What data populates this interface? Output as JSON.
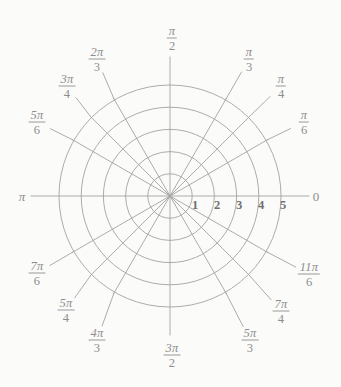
{
  "figure": {
    "type": "polar-grid",
    "title": "",
    "background_color": "#fbfbfa",
    "grid_color": "#a3a3a3",
    "label_color": "#8d8d8d",
    "tick_label_color": "#6f6f6f"
  },
  "chart_data": {
    "type": "polar-grid",
    "title": "",
    "xlabel": "",
    "ylabel": "",
    "grid": true,
    "legend": "none",
    "center_px": [
      170,
      196
    ],
    "outer_radius_px": 111,
    "radial_ticks": [
      1,
      2,
      3,
      4,
      5
    ],
    "radial_range": [
      0,
      5
    ],
    "radial_tick_labels": [
      "1",
      "2",
      "3",
      "4",
      "5"
    ],
    "angular_ticks_deg": [
      0,
      30,
      45,
      60,
      90,
      120,
      135,
      150,
      180,
      210,
      225,
      240,
      270,
      300,
      315,
      330
    ],
    "angular_tick_labels": [
      "0",
      "π/6",
      "π/4",
      "π/3",
      "π/2",
      "2π/3",
      "3π/4",
      "5π/6",
      "π",
      "7π/6",
      "5π/4",
      "4π/3",
      "3π/2",
      "5π/3",
      "7π/4",
      "11π/6"
    ],
    "series": [],
    "values": []
  },
  "angle_labels": [
    {
      "id": "zero",
      "kind": "plain",
      "text": "0",
      "deg": 0,
      "x": 316,
      "y": 196
    },
    {
      "id": "pi-over-6",
      "kind": "frac",
      "num": "π",
      "den": "6",
      "deg": 30,
      "x": 304,
      "y": 122
    },
    {
      "id": "pi-over-4",
      "kind": "frac",
      "num": "π",
      "den": "4",
      "deg": 45,
      "x": 281,
      "y": 86
    },
    {
      "id": "pi-over-3",
      "kind": "frac",
      "num": "π",
      "den": "3",
      "deg": 60,
      "x": 249,
      "y": 59
    },
    {
      "id": "pi-over-2",
      "kind": "frac",
      "num": "π",
      "den": "2",
      "deg": 90,
      "x": 172,
      "y": 38
    },
    {
      "id": "two-pi-over-3",
      "kind": "frac",
      "num": "2π",
      "den": "3",
      "deg": 120,
      "x": 97,
      "y": 59
    },
    {
      "id": "three-pi-over-4",
      "kind": "frac",
      "num": "3π",
      "den": "4",
      "deg": 135,
      "x": 67,
      "y": 86
    },
    {
      "id": "five-pi-over-6",
      "kind": "frac",
      "num": "5π",
      "den": "6",
      "deg": 150,
      "x": 37,
      "y": 122
    },
    {
      "id": "pi",
      "kind": "plain",
      "text": "π",
      "deg": 180,
      "x": 22,
      "y": 196
    },
    {
      "id": "seven-pi-over-6",
      "kind": "frac",
      "num": "7π",
      "den": "6",
      "deg": 210,
      "x": 37,
      "y": 273
    },
    {
      "id": "five-pi-over-4",
      "kind": "frac",
      "num": "5π",
      "den": "4",
      "deg": 225,
      "x": 66,
      "y": 310
    },
    {
      "id": "four-pi-over-3",
      "kind": "frac",
      "num": "4π",
      "den": "3",
      "deg": 240,
      "x": 97,
      "y": 340
    },
    {
      "id": "three-pi-over-2",
      "kind": "frac",
      "num": "3π",
      "den": "2",
      "deg": 270,
      "x": 172,
      "y": 355
    },
    {
      "id": "five-pi-over-3",
      "kind": "frac",
      "num": "5π",
      "den": "3",
      "deg": 300,
      "x": 250,
      "y": 340
    },
    {
      "id": "seven-pi-over-4",
      "kind": "frac",
      "num": "7π",
      "den": "4",
      "deg": 315,
      "x": 281,
      "y": 311
    },
    {
      "id": "eleven-pi-over-6",
      "kind": "frac",
      "num": "11π",
      "den": "6",
      "deg": 330,
      "x": 309,
      "y": 274
    }
  ],
  "radial_tick_labels": [
    {
      "id": "r1",
      "text": "1",
      "x": 195,
      "y": 199
    },
    {
      "id": "r2",
      "text": "2",
      "x": 217,
      "y": 199
    },
    {
      "id": "r3",
      "text": "3",
      "x": 239,
      "y": 199
    },
    {
      "id": "r4",
      "text": "4",
      "x": 261,
      "y": 199
    },
    {
      "id": "r5",
      "text": "5",
      "x": 283,
      "y": 199
    }
  ]
}
